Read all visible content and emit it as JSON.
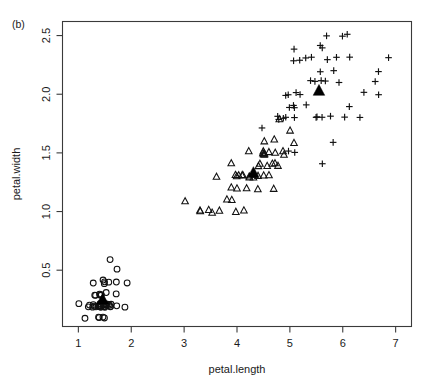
{
  "panel": {
    "label": "(b)"
  },
  "axes": {
    "x": {
      "title": "petal.length",
      "ticks": [
        1,
        2,
        3,
        4,
        5,
        6,
        7
      ],
      "tick_labels": [
        "1",
        "2",
        "3",
        "4",
        "5",
        "6",
        "7"
      ],
      "lim": [
        0.7,
        7.3
      ]
    },
    "y": {
      "title": "petal.width",
      "ticks": [
        0.5,
        1.0,
        1.5,
        2.0,
        2.5
      ],
      "tick_labels": [
        "0.5",
        "1.0",
        "1.5",
        "2.0",
        "2.5"
      ],
      "lim": [
        0.02,
        2.62
      ]
    }
  },
  "chart_data": {
    "type": "scatter",
    "title": "",
    "subtitle": "",
    "xlabel": "petal.length",
    "ylabel": "petal.width",
    "xlim": [
      0.7,
      7.3
    ],
    "ylim": [
      0.02,
      2.62
    ],
    "grid": false,
    "legend": "none",
    "annotations": [
      "(b)"
    ],
    "series": [
      {
        "name": "group-1",
        "marker": "open-circle",
        "color": "#111111",
        "points": [
          [
            1.4,
            0.2
          ],
          [
            1.4,
            0.2
          ],
          [
            1.3,
            0.2
          ],
          [
            1.5,
            0.2
          ],
          [
            1.4,
            0.2
          ],
          [
            1.7,
            0.4
          ],
          [
            1.4,
            0.3
          ],
          [
            1.5,
            0.2
          ],
          [
            1.4,
            0.2
          ],
          [
            1.5,
            0.1
          ],
          [
            1.5,
            0.2
          ],
          [
            1.6,
            0.2
          ],
          [
            1.4,
            0.1
          ],
          [
            1.1,
            0.1
          ],
          [
            1.2,
            0.2
          ],
          [
            1.5,
            0.4
          ],
          [
            1.3,
            0.4
          ],
          [
            1.4,
            0.3
          ],
          [
            1.7,
            0.3
          ],
          [
            1.5,
            0.3
          ],
          [
            1.7,
            0.2
          ],
          [
            1.5,
            0.4
          ],
          [
            1.0,
            0.2
          ],
          [
            1.7,
            0.5
          ],
          [
            1.9,
            0.2
          ],
          [
            1.6,
            0.2
          ],
          [
            1.6,
            0.4
          ],
          [
            1.5,
            0.2
          ],
          [
            1.4,
            0.2
          ],
          [
            1.6,
            0.2
          ],
          [
            1.6,
            0.2
          ],
          [
            1.5,
            0.4
          ],
          [
            1.5,
            0.1
          ],
          [
            1.4,
            0.2
          ],
          [
            1.5,
            0.2
          ],
          [
            1.2,
            0.2
          ],
          [
            1.3,
            0.2
          ],
          [
            1.4,
            0.1
          ],
          [
            1.3,
            0.2
          ],
          [
            1.5,
            0.2
          ],
          [
            1.3,
            0.3
          ],
          [
            1.3,
            0.3
          ],
          [
            1.3,
            0.2
          ],
          [
            1.6,
            0.6
          ],
          [
            1.9,
            0.4
          ],
          [
            1.4,
            0.3
          ],
          [
            1.6,
            0.2
          ],
          [
            1.4,
            0.2
          ],
          [
            1.5,
            0.2
          ],
          [
            1.4,
            0.2
          ]
        ]
      },
      {
        "name": "group-2",
        "marker": "open-triangle",
        "color": "#111111",
        "points": [
          [
            4.7,
            1.4
          ],
          [
            4.5,
            1.5
          ],
          [
            4.9,
            1.5
          ],
          [
            4.0,
            1.3
          ],
          [
            4.6,
            1.5
          ],
          [
            4.5,
            1.3
          ],
          [
            4.7,
            1.6
          ],
          [
            3.3,
            1.0
          ],
          [
            4.6,
            1.3
          ],
          [
            3.9,
            1.4
          ],
          [
            3.5,
            1.0
          ],
          [
            4.2,
            1.5
          ],
          [
            4.0,
            1.0
          ],
          [
            4.7,
            1.4
          ],
          [
            3.6,
            1.3
          ],
          [
            4.4,
            1.4
          ],
          [
            4.5,
            1.5
          ],
          [
            4.1,
            1.0
          ],
          [
            4.5,
            1.5
          ],
          [
            3.9,
            1.1
          ],
          [
            4.8,
            1.8
          ],
          [
            4.0,
            1.3
          ],
          [
            4.9,
            1.5
          ],
          [
            4.7,
            1.2
          ],
          [
            4.3,
            1.3
          ],
          [
            4.4,
            1.4
          ],
          [
            4.8,
            1.4
          ],
          [
            5.0,
            1.7
          ],
          [
            4.5,
            1.5
          ],
          [
            3.5,
            1.0
          ],
          [
            3.8,
            1.1
          ],
          [
            3.7,
            1.0
          ],
          [
            3.9,
            1.2
          ],
          [
            5.1,
            1.6
          ],
          [
            4.5,
            1.5
          ],
          [
            4.5,
            1.6
          ],
          [
            4.7,
            1.5
          ],
          [
            4.4,
            1.3
          ],
          [
            4.1,
            1.3
          ],
          [
            4.0,
            1.3
          ],
          [
            4.4,
            1.2
          ],
          [
            4.6,
            1.4
          ],
          [
            4.0,
            1.2
          ],
          [
            3.3,
            1.0
          ],
          [
            4.2,
            1.3
          ],
          [
            4.2,
            1.2
          ],
          [
            4.2,
            1.3
          ],
          [
            4.3,
            1.3
          ],
          [
            3.0,
            1.1
          ],
          [
            4.1,
            1.3
          ]
        ]
      },
      {
        "name": "group-3",
        "marker": "plus",
        "color": "#111111",
        "points": [
          [
            6.0,
            2.5
          ],
          [
            5.1,
            1.9
          ],
          [
            5.9,
            2.1
          ],
          [
            5.6,
            1.8
          ],
          [
            5.8,
            2.2
          ],
          [
            6.6,
            2.1
          ],
          [
            4.5,
            1.7
          ],
          [
            6.3,
            1.8
          ],
          [
            5.8,
            1.8
          ],
          [
            6.1,
            2.5
          ],
          [
            5.1,
            2.0
          ],
          [
            5.3,
            1.9
          ],
          [
            5.5,
            2.1
          ],
          [
            5.0,
            2.0
          ],
          [
            5.1,
            2.4
          ],
          [
            5.3,
            2.3
          ],
          [
            5.5,
            1.8
          ],
          [
            6.7,
            2.2
          ],
          [
            6.9,
            2.3
          ],
          [
            5.0,
            1.5
          ],
          [
            5.7,
            2.3
          ],
          [
            4.9,
            2.0
          ],
          [
            6.7,
            2.0
          ],
          [
            4.9,
            1.8
          ],
          [
            5.7,
            2.1
          ],
          [
            6.0,
            1.8
          ],
          [
            4.8,
            1.8
          ],
          [
            4.9,
            1.8
          ],
          [
            5.6,
            2.1
          ],
          [
            5.8,
            1.6
          ],
          [
            6.1,
            1.9
          ],
          [
            6.4,
            2.0
          ],
          [
            5.6,
            2.2
          ],
          [
            5.1,
            1.5
          ],
          [
            5.6,
            1.4
          ],
          [
            6.1,
            2.3
          ],
          [
            5.6,
            2.4
          ],
          [
            5.5,
            1.8
          ],
          [
            4.8,
            1.8
          ],
          [
            5.4,
            2.1
          ],
          [
            5.6,
            2.4
          ],
          [
            5.1,
            2.3
          ],
          [
            5.1,
            1.9
          ],
          [
            5.9,
            2.3
          ],
          [
            5.7,
            2.5
          ],
          [
            5.2,
            2.3
          ],
          [
            5.0,
            1.9
          ],
          [
            5.2,
            2.0
          ],
          [
            5.4,
            2.3
          ],
          [
            5.1,
            1.8
          ]
        ]
      }
    ],
    "centroids": [
      {
        "name": "centroid-group-1",
        "marker": "filled-triangle",
        "x": 1.46,
        "y": 0.25
      },
      {
        "name": "centroid-group-2",
        "marker": "filled-triangle",
        "x": 4.31,
        "y": 1.33
      },
      {
        "name": "centroid-group-3",
        "marker": "filled-triangle",
        "x": 5.55,
        "y": 2.03
      }
    ]
  }
}
